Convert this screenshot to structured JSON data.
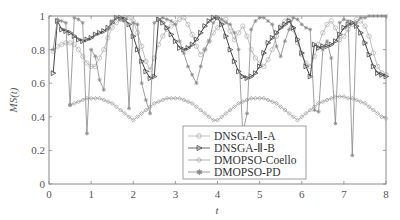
{
  "chart_data": {
    "type": "line",
    "title": "",
    "xlabel": "t",
    "ylabel": "MS(t)",
    "xlim": [
      0,
      8
    ],
    "ylim": [
      0,
      1
    ],
    "xticks": [
      "0",
      "1",
      "2",
      "3",
      "4",
      "5",
      "6",
      "7",
      "8"
    ],
    "yticks": [
      "0",
      "0.2",
      "0.4",
      "0.6",
      "0.8",
      "1"
    ],
    "grid": false,
    "legend_position": "lower right (inside)",
    "series": [
      {
        "name": "DNSGA-Ⅱ-A",
        "marker": "circle",
        "color": "#b0b0b0",
        "x": [
          0.1,
          0.2,
          0.3,
          0.4,
          0.5,
          0.6,
          0.7,
          0.8,
          0.9,
          1.0,
          1.1,
          1.2,
          1.3,
          1.4,
          1.5,
          1.6,
          1.7,
          1.8,
          1.9,
          2.0,
          2.1,
          2.2,
          2.3,
          2.4,
          2.5,
          2.6,
          2.7,
          2.8,
          2.9,
          3.0,
          3.1,
          3.2,
          3.3,
          3.4,
          3.5,
          3.6,
          3.7,
          3.8,
          3.9,
          4.0,
          4.1,
          4.2,
          4.3,
          4.4,
          4.5,
          4.6,
          4.7,
          4.8,
          4.9,
          5.0,
          5.1,
          5.2,
          5.3,
          5.4,
          5.5,
          5.6,
          5.7,
          5.8,
          5.9,
          6.0,
          6.1,
          6.2,
          6.3,
          6.4,
          6.5,
          6.6,
          6.7,
          6.8,
          6.9,
          7.0,
          7.1,
          7.2,
          7.3,
          7.4,
          7.5,
          7.6,
          7.7,
          7.8,
          7.9,
          8.0
        ],
        "values": [
          0.79,
          0.82,
          0.83,
          0.84,
          0.84,
          0.83,
          0.8,
          0.76,
          0.72,
          0.7,
          0.7,
          0.75,
          0.8,
          0.87,
          0.93,
          0.96,
          0.98,
          0.99,
          0.99,
          0.97,
          0.9,
          0.82,
          0.73,
          0.68,
          0.75,
          0.83,
          0.88,
          0.92,
          0.94,
          0.96,
          0.98,
          0.99,
          0.95,
          0.89,
          0.82,
          0.77,
          0.8,
          0.85,
          0.9,
          0.93,
          0.96,
          0.98,
          0.91,
          0.86,
          0.9,
          0.94,
          0.88,
          0.8,
          0.75,
          0.72,
          0.7,
          0.74,
          0.8,
          0.88,
          0.94,
          0.97,
          0.99,
          0.92,
          0.84,
          0.77,
          0.72,
          0.7,
          0.76,
          0.83,
          0.9,
          0.95,
          0.97,
          0.93,
          0.86,
          0.88,
          0.92,
          0.95,
          0.98,
          0.97,
          0.94,
          0.88,
          0.78,
          0.7,
          0.66,
          0.65
        ]
      },
      {
        "name": "DNSGA-Ⅱ-B",
        "marker": "triangle-right",
        "color": "#444444",
        "x": [
          0.1,
          0.2,
          0.3,
          0.4,
          0.5,
          0.6,
          0.7,
          0.8,
          0.9,
          1.0,
          1.1,
          1.2,
          1.3,
          1.4,
          1.5,
          1.6,
          1.7,
          1.8,
          1.9,
          2.0,
          2.1,
          2.2,
          2.3,
          2.4,
          2.5,
          2.6,
          2.7,
          2.8,
          2.9,
          3.0,
          3.1,
          3.2,
          3.3,
          3.4,
          3.5,
          3.6,
          3.7,
          3.8,
          3.9,
          4.0,
          4.1,
          4.2,
          4.3,
          4.4,
          4.5,
          4.6,
          4.7,
          4.8,
          4.9,
          5.0,
          5.1,
          5.2,
          5.3,
          5.4,
          5.5,
          5.6,
          5.7,
          5.8,
          5.9,
          6.0,
          6.1,
          6.2,
          6.3,
          6.4,
          6.5,
          6.6,
          6.7,
          6.8,
          6.9,
          7.0,
          7.1,
          7.2,
          7.3,
          7.4,
          7.5,
          7.6,
          7.7,
          7.8,
          7.9,
          8.0
        ],
        "values": [
          0.66,
          0.97,
          0.92,
          0.91,
          0.9,
          0.88,
          0.86,
          0.85,
          0.86,
          0.87,
          0.89,
          0.9,
          0.91,
          0.93,
          0.96,
          0.99,
          0.99,
          0.98,
          0.95,
          0.88,
          0.8,
          0.73,
          0.67,
          0.63,
          0.64,
          0.98,
          0.96,
          0.93,
          0.89,
          0.85,
          0.81,
          0.8,
          0.81,
          0.83,
          0.86,
          0.9,
          0.94,
          0.97,
          0.99,
          0.99,
          0.95,
          0.88,
          0.8,
          0.73,
          0.67,
          0.64,
          0.63,
          0.64,
          0.66,
          0.7,
          0.78,
          0.84,
          0.87,
          0.9,
          0.93,
          0.95,
          0.97,
          0.93,
          0.86,
          0.78,
          0.7,
          0.64,
          0.83,
          0.81,
          0.82,
          0.82,
          0.83,
          0.85,
          0.89,
          0.93,
          0.95,
          0.96,
          0.94,
          0.9,
          0.84,
          0.77,
          0.7,
          0.66,
          0.65,
          0.64
        ]
      },
      {
        "name": "DMOPSO-Coello",
        "marker": "diamond",
        "color": "#999999",
        "x": [
          0.5,
          0.6,
          0.7,
          0.8,
          0.9,
          1.0,
          1.1,
          1.2,
          1.3,
          1.4,
          1.5,
          1.6,
          1.7,
          1.8,
          1.9,
          2.0,
          2.1,
          2.2,
          2.3,
          2.4,
          2.5,
          2.6,
          2.7,
          2.8,
          2.9,
          3.0,
          3.1,
          3.2,
          3.3,
          3.4,
          3.5,
          3.6,
          3.7,
          3.8,
          3.9,
          4.0,
          4.1,
          4.2,
          4.3,
          4.4,
          4.5,
          4.6,
          4.7,
          4.8,
          4.9,
          5.0,
          5.1,
          5.2,
          5.3,
          5.4,
          5.5,
          5.6,
          5.7,
          5.8,
          5.9,
          6.0,
          6.1,
          6.2,
          6.3,
          6.4,
          6.5,
          6.6,
          6.7,
          6.8,
          6.9,
          7.0,
          7.1,
          7.2,
          7.3,
          7.4,
          7.5,
          7.6,
          7.7,
          7.8,
          7.9,
          8.0
        ],
        "values": [
          0.47,
          0.48,
          0.49,
          0.5,
          0.51,
          0.51,
          0.51,
          0.51,
          0.5,
          0.49,
          0.48,
          0.46,
          0.44,
          0.42,
          0.4,
          0.38,
          0.4,
          0.42,
          0.44,
          0.46,
          0.48,
          0.49,
          0.5,
          0.51,
          0.51,
          0.51,
          0.51,
          0.5,
          0.49,
          0.48,
          0.46,
          0.44,
          0.42,
          0.4,
          0.38,
          0.38,
          0.4,
          0.42,
          0.44,
          0.46,
          0.48,
          0.49,
          0.5,
          0.51,
          0.51,
          0.51,
          0.51,
          0.5,
          0.49,
          0.48,
          0.46,
          0.44,
          0.42,
          0.4,
          0.38,
          0.4,
          0.42,
          0.44,
          0.46,
          0.48,
          0.49,
          0.5,
          0.51,
          0.52,
          0.52,
          0.52,
          0.51,
          0.51,
          0.5,
          0.49,
          0.48,
          0.46,
          0.44,
          0.42,
          0.4,
          0.39
        ]
      },
      {
        "name": "DMOPSO-PD",
        "marker": "star",
        "color": "#888888",
        "x": [
          0.1,
          0.2,
          0.3,
          0.4,
          0.5,
          0.6,
          0.7,
          0.8,
          0.9,
          1.0,
          1.1,
          1.2,
          1.3,
          1.4,
          1.5,
          1.6,
          1.7,
          1.8,
          1.9,
          2.0,
          2.1,
          2.2,
          2.3,
          2.4,
          2.5,
          2.6,
          2.7,
          2.8,
          2.9,
          3.0,
          3.1,
          3.2,
          3.3,
          3.4,
          3.5,
          3.6,
          3.7,
          3.8,
          3.9,
          4.0,
          4.1,
          4.2,
          4.3,
          4.4,
          4.5,
          4.6,
          4.7,
          4.8,
          4.9,
          5.0,
          5.1,
          5.2,
          5.3,
          5.4,
          5.5,
          5.6,
          5.7,
          5.8,
          5.9,
          6.0,
          6.1,
          6.2,
          6.3,
          6.4,
          6.5,
          6.6,
          6.7,
          6.8,
          6.9,
          7.0,
          7.1,
          7.2,
          7.3,
          7.4,
          7.5,
          7.6,
          7.7,
          7.8,
          7.9,
          8.0
        ],
        "values": [
          0.8,
          0.98,
          0.97,
          0.96,
          0.47,
          0.99,
          0.98,
          0.96,
          0.3,
          0.8,
          0.76,
          0.62,
          0.56,
          0.92,
          0.97,
          0.99,
          0.98,
          0.97,
          0.45,
          0.96,
          0.95,
          0.6,
          0.5,
          0.42,
          0.96,
          0.98,
          0.99,
          0.98,
          0.97,
          0.95,
          0.85,
          0.78,
          0.7,
          0.65,
          0.6,
          0.7,
          0.8,
          0.85,
          0.96,
          0.99,
          0.98,
          0.96,
          0.95,
          0.9,
          0.8,
          0.3,
          0.42,
          0.92,
          0.97,
          0.99,
          0.99,
          0.97,
          0.95,
          0.82,
          0.76,
          0.85,
          0.92,
          0.99,
          0.98,
          0.95,
          0.93,
          0.92,
          0.44,
          0.43,
          0.8,
          0.85,
          0.75,
          0.36,
          0.96,
          0.98,
          0.97,
          0.17,
          0.96,
          0.99,
          0.99,
          1.0,
          1.0,
          1.0,
          1.0,
          1.0
        ]
      }
    ]
  },
  "legend": {
    "items": [
      {
        "label": "DNSGA-Ⅱ-A"
      },
      {
        "label": "DNSGA-Ⅱ-B"
      },
      {
        "label": "DMOPSO-Coello"
      },
      {
        "label": "DMOPSO-PD"
      }
    ]
  },
  "axes": {
    "xlabel": "t",
    "ylabel": "MS(t)"
  }
}
